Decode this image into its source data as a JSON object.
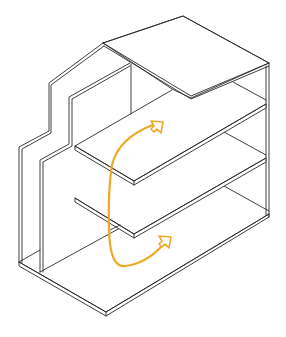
{
  "diagram": {
    "floors": 3,
    "arrow_count": 2,
    "colors": {
      "line": "#2a2a2a",
      "background": "#ffffff",
      "arrow": "#f0a926"
    }
  }
}
